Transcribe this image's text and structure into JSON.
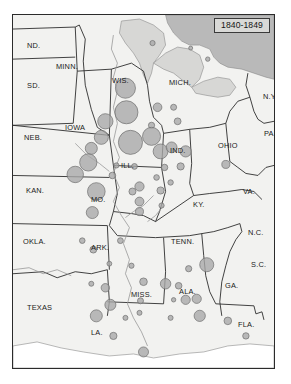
{
  "figure": {
    "title": "1840-1849",
    "kind": "proportional-symbol-map",
    "region": "Central and Southeastern United States",
    "frame_color": "#2b2b2b",
    "land_color": "#f2f2f0",
    "water_color": "#b9b9b9",
    "symbol_fill": "#a8a8a8",
    "symbol_stroke": "#6e6e6e",
    "title_box_fill": "#d9d9d7"
  },
  "state_labels": [
    {
      "name": "ND.",
      "x": 14,
      "y": 26
    },
    {
      "name": "SD.",
      "x": 14,
      "y": 66
    },
    {
      "name": "NEB.",
      "x": 11,
      "y": 118
    },
    {
      "name": "KAN.",
      "x": 13,
      "y": 171
    },
    {
      "name": "OKLA.",
      "x": 10,
      "y": 222
    },
    {
      "name": "TEXAS",
      "x": 14,
      "y": 288
    },
    {
      "name": "MINN.",
      "x": 43,
      "y": 47
    },
    {
      "name": "IOWA",
      "x": 52,
      "y": 108
    },
    {
      "name": "MO.",
      "x": 78,
      "y": 180
    },
    {
      "name": "ARK.",
      "x": 78,
      "y": 228
    },
    {
      "name": "LA.",
      "x": 78,
      "y": 313
    },
    {
      "name": "WIS.",
      "x": 99,
      "y": 61
    },
    {
      "name": "ILL.",
      "x": 108,
      "y": 146
    },
    {
      "name": "MISS.",
      "x": 118,
      "y": 275
    },
    {
      "name": "MICH.",
      "x": 156,
      "y": 63
    },
    {
      "name": "IND.",
      "x": 157,
      "y": 131
    },
    {
      "name": "ALA.",
      "x": 166,
      "y": 272
    },
    {
      "name": "KY.",
      "x": 180,
      "y": 185
    },
    {
      "name": "TENN.",
      "x": 158,
      "y": 222
    },
    {
      "name": "FLA.",
      "x": 225,
      "y": 305
    },
    {
      "name": "GA.",
      "x": 212,
      "y": 266
    },
    {
      "name": "OHIO",
      "x": 205,
      "y": 126
    },
    {
      "name": "VA.",
      "x": 230,
      "y": 172
    },
    {
      "name": "N.C.",
      "x": 235,
      "y": 213
    },
    {
      "name": "S.C.",
      "x": 238,
      "y": 245
    },
    {
      "name": "N.Y.",
      "x": 250,
      "y": 77
    },
    {
      "name": "PA.",
      "x": 251,
      "y": 114
    }
  ],
  "chart_data": {
    "type": "scatter",
    "title": "1840-1849",
    "xlabel": "longitude (map x)",
    "ylabel": "latitude (map y)",
    "symbol_units": "radius proportional to count",
    "note": "Proportional circles placed at settlement locations on a US base map.",
    "points": [
      {
        "x": 139,
        "y": 28,
        "r": 2.6
      },
      {
        "x": 177,
        "y": 33,
        "r": 2.0
      },
      {
        "x": 194,
        "y": 44,
        "r": 2.2
      },
      {
        "x": 112,
        "y": 73,
        "r": 10.0
      },
      {
        "x": 113,
        "y": 97,
        "r": 11.5
      },
      {
        "x": 144,
        "y": 92,
        "r": 4.3
      },
      {
        "x": 160,
        "y": 92,
        "r": 3.0
      },
      {
        "x": 138,
        "y": 110,
        "r": 3.1
      },
      {
        "x": 164,
        "y": 106,
        "r": 3.4
      },
      {
        "x": 92,
        "y": 106,
        "r": 7.6
      },
      {
        "x": 88,
        "y": 122,
        "r": 7.0
      },
      {
        "x": 78,
        "y": 133,
        "r": 6.0
      },
      {
        "x": 75,
        "y": 147,
        "r": 8.6
      },
      {
        "x": 117,
        "y": 127,
        "r": 12.0
      },
      {
        "x": 138,
        "y": 121,
        "r": 9.0
      },
      {
        "x": 147,
        "y": 136,
        "r": 7.4
      },
      {
        "x": 158,
        "y": 132,
        "r": 5.4
      },
      {
        "x": 172,
        "y": 136,
        "r": 5.6
      },
      {
        "x": 151,
        "y": 152,
        "r": 3.2
      },
      {
        "x": 167,
        "y": 151,
        "r": 3.6
      },
      {
        "x": 121,
        "y": 151,
        "r": 2.9
      },
      {
        "x": 103,
        "y": 150,
        "r": 2.6
      },
      {
        "x": 143,
        "y": 162,
        "r": 2.8
      },
      {
        "x": 157,
        "y": 167,
        "r": 2.7
      },
      {
        "x": 99,
        "y": 160,
        "r": 3.3
      },
      {
        "x": 212,
        "y": 149,
        "r": 4.0
      },
      {
        "x": 62,
        "y": 159,
        "r": 8.2
      },
      {
        "x": 83,
        "y": 176,
        "r": 8.8
      },
      {
        "x": 79,
        "y": 197,
        "r": 6.0
      },
      {
        "x": 119,
        "y": 176,
        "r": 3.5
      },
      {
        "x": 126,
        "y": 171,
        "r": 4.6
      },
      {
        "x": 126,
        "y": 186,
        "r": 4.4
      },
      {
        "x": 126,
        "y": 196,
        "r": 4.0
      },
      {
        "x": 147,
        "y": 175,
        "r": 3.6
      },
      {
        "x": 148,
        "y": 190,
        "r": 2.6
      },
      {
        "x": 69,
        "y": 225,
        "r": 2.8
      },
      {
        "x": 80,
        "y": 234,
        "r": 3.4
      },
      {
        "x": 107,
        "y": 225,
        "r": 2.9
      },
      {
        "x": 96,
        "y": 248,
        "r": 2.4
      },
      {
        "x": 118,
        "y": 250,
        "r": 2.6
      },
      {
        "x": 78,
        "y": 268,
        "r": 2.5
      },
      {
        "x": 130,
        "y": 266,
        "r": 3.8
      },
      {
        "x": 152,
        "y": 268,
        "r": 5.2
      },
      {
        "x": 165,
        "y": 270,
        "r": 3.3
      },
      {
        "x": 175,
        "y": 253,
        "r": 3.1
      },
      {
        "x": 193,
        "y": 249,
        "r": 7.0
      },
      {
        "x": 160,
        "y": 284,
        "r": 2.2
      },
      {
        "x": 172,
        "y": 284,
        "r": 4.6
      },
      {
        "x": 183,
        "y": 283,
        "r": 4.6
      },
      {
        "x": 127,
        "y": 285,
        "r": 3.0
      },
      {
        "x": 126,
        "y": 297,
        "r": 2.5
      },
      {
        "x": 92,
        "y": 272,
        "r": 4.2
      },
      {
        "x": 97,
        "y": 289,
        "r": 5.5
      },
      {
        "x": 83,
        "y": 300,
        "r": 6.0
      },
      {
        "x": 112,
        "y": 302,
        "r": 2.5
      },
      {
        "x": 157,
        "y": 302,
        "r": 2.5
      },
      {
        "x": 186,
        "y": 300,
        "r": 5.6
      },
      {
        "x": 100,
        "y": 320,
        "r": 3.6
      },
      {
        "x": 130,
        "y": 336,
        "r": 5.0
      },
      {
        "x": 214,
        "y": 305,
        "r": 3.8
      },
      {
        "x": 232,
        "y": 320,
        "r": 3.2
      }
    ]
  }
}
